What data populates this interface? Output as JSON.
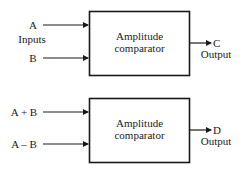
{
  "diagram": {
    "top": {
      "block_label_line1": "Amplitude",
      "block_label_line2": "comparator",
      "input_a": "A",
      "input_b": "B",
      "inputs_label": "Inputs",
      "output_name": "C",
      "output_label": "Output"
    },
    "bottom": {
      "block_label_line1": "Amplitude",
      "block_label_line2": "comparator",
      "input_a": "A + B",
      "input_b": "A – B",
      "output_name": "D",
      "output_label": "Output"
    },
    "colors": {
      "stroke": "#1a1a1a",
      "background": "#ffffff"
    }
  }
}
